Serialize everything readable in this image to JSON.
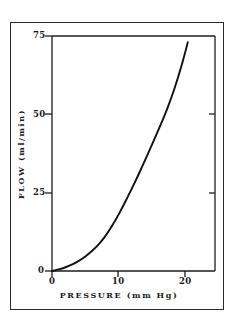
{
  "figure": {
    "background_color": "#ffffff",
    "frame_color": "#2b2b2b",
    "curve_color": "#111111"
  },
  "chart_data": {
    "type": "line",
    "title": "",
    "xlabel": "PRESSURE (mm Hg)",
    "ylabel": "FLOW (ml/min)",
    "xlim": [
      0,
      24
    ],
    "ylim": [
      0,
      75
    ],
    "grid": false,
    "legend": null,
    "x_ticks": [
      0,
      10,
      20
    ],
    "x_tick_labels": [
      "0",
      "10",
      "20"
    ],
    "y_ticks": [
      0,
      25,
      50,
      75
    ],
    "y_tick_labels": [
      "0",
      "25",
      "50",
      "75"
    ],
    "series": [
      {
        "name": "flow-pressure-curve",
        "color": "#111111",
        "x": [
          0,
          1,
          2,
          3,
          4,
          5,
          6,
          7,
          8,
          9,
          10,
          11,
          12,
          13,
          14,
          15,
          16,
          17,
          18,
          19,
          20
        ],
        "y": [
          0,
          0.5,
          1.2,
          2.1,
          3.3,
          4.8,
          6.6,
          8.8,
          11.6,
          15.0,
          18.8,
          23.0,
          27.4,
          32.0,
          36.8,
          41.7,
          46.7,
          52.0,
          58.0,
          65.0,
          73.0
        ]
      }
    ]
  },
  "axis_titles": {
    "x": "PRESSURE (mm Hg)",
    "y": "FLOW (ml/min)"
  },
  "tick_labels": {
    "y75": "75",
    "y50": "50",
    "y25": "25",
    "y0": "0",
    "x0": "0",
    "x10": "10",
    "x20": "20"
  }
}
